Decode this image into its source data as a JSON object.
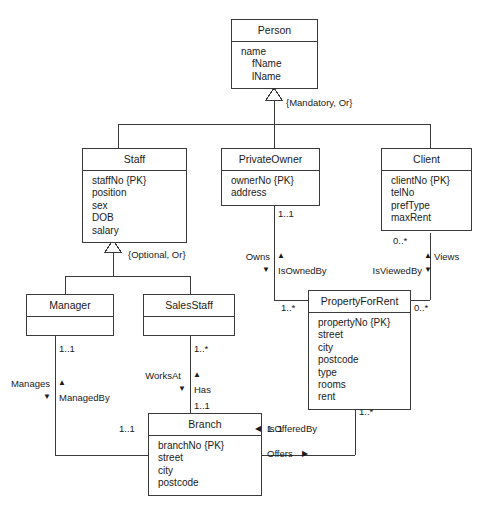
{
  "diagram": {
    "type": "uml-class-diagram",
    "title": "",
    "classes": [
      {
        "id": "person",
        "name": "Person",
        "attributes": [
          "name",
          "fName",
          "lName"
        ],
        "indented": [
          false,
          true,
          true
        ]
      },
      {
        "id": "staff",
        "name": "Staff",
        "attributes": [
          "staffNo {PK}",
          "position",
          "sex",
          "DOB",
          "salary"
        ],
        "indented": [
          false,
          false,
          false,
          false,
          false
        ]
      },
      {
        "id": "privateowner",
        "name": "PrivateOwner",
        "attributes": [
          "ownerNo {PK}",
          "address"
        ],
        "indented": [
          false,
          false
        ]
      },
      {
        "id": "client",
        "name": "Client",
        "attributes": [
          "clientNo {PK}",
          "telNo",
          "prefType",
          "maxRent"
        ],
        "indented": [
          false,
          false,
          false,
          false
        ]
      },
      {
        "id": "manager",
        "name": "Manager",
        "attributes": [],
        "indented": []
      },
      {
        "id": "salesstaff",
        "name": "SalesStaff",
        "attributes": [],
        "indented": []
      },
      {
        "id": "propertyforrent",
        "name": "PropertyForRent",
        "attributes": [
          "propertyNo {PK}",
          "street",
          "city",
          "postcode",
          "type",
          "rooms",
          "rent"
        ],
        "indented": [
          false,
          false,
          false,
          false,
          false,
          false,
          false
        ]
      },
      {
        "id": "branch",
        "name": "Branch",
        "attributes": [
          "branchNo {PK}",
          "street",
          "city",
          "postcode"
        ],
        "indented": [
          false,
          false,
          false,
          false
        ]
      }
    ],
    "constraints": [
      {
        "id": "mandatory-or",
        "text": "{Mandatory, Or}"
      },
      {
        "id": "optional-or",
        "text": "{Optional, Or}"
      }
    ],
    "role_labels": {
      "owns": "Owns",
      "is_owned_by": "IsOwnedBy",
      "is_viewed_by": "IsViewedBy",
      "views": "Views",
      "manages": "Manages",
      "managed_by": "ManagedBy",
      "works_at": "WorksAt",
      "has": "Has",
      "is_offered_by": "IsOfferedBy",
      "offers": "Offers"
    },
    "multiplicities": {
      "privateowner_bottom": "1..1",
      "client_bottom": "0..*",
      "property_left": "1..*",
      "property_right": "0..*",
      "property_bottom": "1..*",
      "manager_bottom": "1..1",
      "salesstaff_bottom": "1..*",
      "branch_top": "1..1",
      "branch_left": "1..1",
      "branch_right": "1..1"
    },
    "arrow_glyphs": {
      "up": "▲",
      "down": "▼",
      "left": "◀",
      "right": "▶"
    },
    "colors": {
      "stroke": "#3a3a3a",
      "text": "#1a1a1a",
      "background": "#ffffff"
    }
  }
}
